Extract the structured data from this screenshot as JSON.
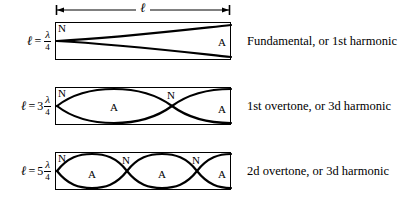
{
  "figure": {
    "dimension": {
      "label": "ℓ",
      "name": "length-dimension"
    },
    "colors": {
      "ink": "#000000",
      "background": "#ffffff"
    },
    "node_label": "N",
    "antinode_label": "A",
    "rows": [
      {
        "equation": {
          "symbol": "ℓ",
          "equals": "=",
          "coefficient": "",
          "numerator": "λ",
          "denominator": "4"
        },
        "caption": "Fundamental, or 1st harmonic",
        "harmonic_number": 1,
        "wavelengths_in_tube": 0.25,
        "nodes": [
          {
            "label": "N",
            "x_pct": 0,
            "y": "top"
          }
        ],
        "antinodes": [
          {
            "label": "A",
            "x_pct": 100,
            "y": "mid"
          }
        ]
      },
      {
        "equation": {
          "symbol": "ℓ",
          "equals": "=",
          "coefficient": "3",
          "numerator": "λ",
          "denominator": "4"
        },
        "caption": "1st overtone, or 3d harmonic",
        "harmonic_number": 3,
        "wavelengths_in_tube": 0.75,
        "nodes": [
          {
            "label": "N",
            "x_pct": 0,
            "y": "top"
          },
          {
            "label": "N",
            "x_pct": 66.7,
            "y": "top"
          }
        ],
        "antinodes": [
          {
            "label": "A",
            "x_pct": 33.3,
            "y": "mid"
          },
          {
            "label": "A",
            "x_pct": 100,
            "y": "mid"
          }
        ]
      },
      {
        "equation": {
          "symbol": "ℓ",
          "equals": "=",
          "coefficient": "5",
          "numerator": "λ",
          "denominator": "4"
        },
        "caption": "2d overtone, or 3d harmonic",
        "harmonic_number": 5,
        "wavelengths_in_tube": 1.25,
        "nodes": [
          {
            "label": "N",
            "x_pct": 0,
            "y": "top"
          },
          {
            "label": "N",
            "x_pct": 40,
            "y": "top"
          },
          {
            "label": "N",
            "x_pct": 80,
            "y": "top"
          }
        ],
        "antinodes": [
          {
            "label": "A",
            "x_pct": 20,
            "y": "mid"
          },
          {
            "label": "A",
            "x_pct": 60,
            "y": "mid"
          },
          {
            "label": "A",
            "x_pct": 100,
            "y": "mid"
          }
        ]
      }
    ]
  }
}
